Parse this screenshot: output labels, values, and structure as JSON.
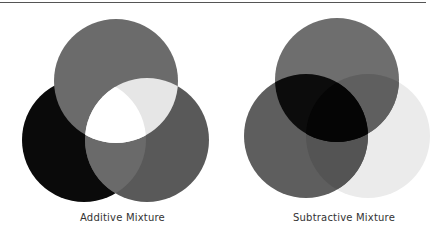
{
  "figures": [
    {
      "id": "additive",
      "label": "Additive Mixture",
      "circles": [
        {
          "name": "top",
          "cx": 116,
          "cy": 81,
          "r": 62,
          "color": "#6b6b6b"
        },
        {
          "name": "left",
          "cx": 84,
          "cy": 140,
          "r": 62,
          "color": "#0a0a0a"
        },
        {
          "name": "right",
          "cx": 147,
          "cy": 140,
          "r": 62,
          "color": "#595959"
        }
      ],
      "overlaps": {
        "top_left": "#6b6b6b",
        "top_right": "#e6e6e6",
        "left_right": "#6a6a6a",
        "center": "#ffffff"
      }
    },
    {
      "id": "subtractive",
      "label": "Subtractive Mixture",
      "circles": [
        {
          "name": "top",
          "cx": 337,
          "cy": 80,
          "r": 62,
          "color": "#6e6e6e"
        },
        {
          "name": "left",
          "cx": 306,
          "cy": 136,
          "r": 62,
          "color": "#5e5e5e"
        },
        {
          "name": "right",
          "cx": 368,
          "cy": 136,
          "r": 62,
          "color": "#ebebeb"
        }
      ],
      "overlaps": {
        "top_left": "#0c0c0c",
        "top_right": "#5f5f5f",
        "left_right": "#545454",
        "center": "#050505"
      }
    }
  ]
}
